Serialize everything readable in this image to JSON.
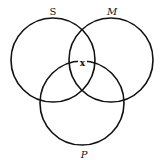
{
  "diagram": {
    "type": "venn",
    "sets": [
      {
        "id": "S",
        "label": "S",
        "cx": 53,
        "cy": 60,
        "r": 42
      },
      {
        "id": "M",
        "label": "M",
        "cx": 111,
        "cy": 60,
        "r": 42
      },
      {
        "id": "P",
        "label": "P",
        "cx": 82,
        "cy": 103,
        "r": 42
      }
    ],
    "marks": [
      {
        "label": "x",
        "region": "S∩M∩P boundary (S∩M, on P)"
      }
    ],
    "stroke_color": "#111111",
    "background": "#ffffff"
  }
}
